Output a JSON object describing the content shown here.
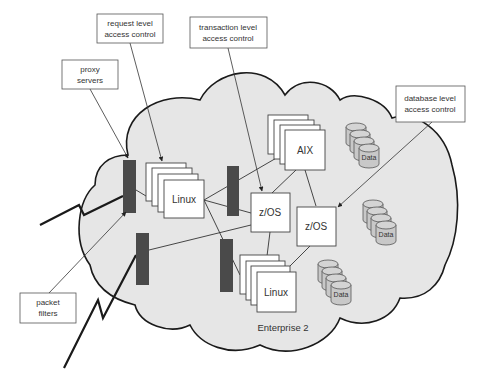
{
  "diagram": {
    "enterprise_label": "Enterprise 2",
    "callouts": {
      "request_level": [
        "request level",
        "access control"
      ],
      "transaction_level": [
        "transaction level",
        "access control"
      ],
      "proxy_servers": [
        "proxy",
        "servers"
      ],
      "database_level": [
        "database level",
        "access control"
      ],
      "packet_filters": [
        "packet",
        "filters"
      ]
    },
    "systems": {
      "linux_1": "Linux",
      "aix": "AIX",
      "zos_1": "z/OS",
      "zos_2": "z/OS",
      "linux_2": "Linux"
    },
    "data_stores": {
      "data_1": "Data",
      "data_2": "Data",
      "data_3": "Data"
    },
    "colors": {
      "cloud_fill": "#e6e6e6",
      "cloud_stroke": "#1a1a1a",
      "firewall": "#4a4a4a",
      "cylinder_fill": "#c8c8c8",
      "box_fill": "#ffffff",
      "line": "#333333"
    }
  }
}
